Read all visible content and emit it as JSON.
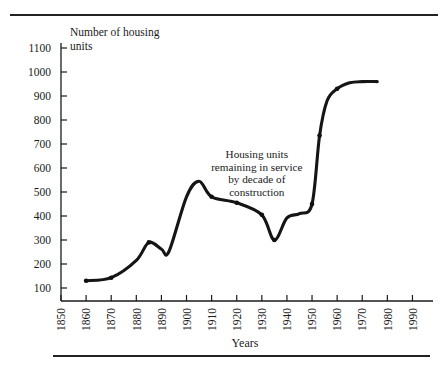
{
  "chart_data": {
    "type": "line",
    "title": "",
    "subtitle": "",
    "xlabel": "Years",
    "ylabel": "Number of housing units",
    "ylabel_line1": "Number of housing",
    "ylabel_line2": "units",
    "annotation": {
      "lines": [
        "Housing units",
        "remaining in service",
        "by decade of",
        "construction"
      ],
      "x": 1928,
      "y": 640
    },
    "xlim": [
      1850,
      1995
    ],
    "ylim": [
      75,
      1115
    ],
    "grid": false,
    "legend": null,
    "xticks": [
      1850,
      1860,
      1870,
      1880,
      1890,
      1900,
      1910,
      1920,
      1930,
      1940,
      1950,
      1960,
      1970,
      1980,
      1990
    ],
    "xtick_labels": [
      "1850",
      "1860",
      "1870",
      "1880",
      "1890",
      "1900",
      "1910",
      "1920",
      "1930",
      "1940",
      "1950",
      "1960",
      "1970",
      "1980",
      "1990"
    ],
    "yticks": [
      100,
      200,
      300,
      400,
      500,
      600,
      700,
      800,
      900,
      1000,
      1100
    ],
    "ytick_labels": [
      "100",
      "200",
      "300",
      "400",
      "500",
      "600",
      "700",
      "800",
      "900",
      "1000",
      "1100"
    ],
    "x": [
      1860,
      1870,
      1880,
      1885,
      1890,
      1893,
      1900,
      1905,
      1910,
      1920,
      1930,
      1935,
      1940,
      1945,
      1950,
      1953,
      1956,
      1960,
      1965,
      1970,
      1976
    ],
    "values": [
      130,
      143,
      215,
      290,
      262,
      252,
      480,
      545,
      480,
      455,
      405,
      300,
      392,
      410,
      450,
      735,
      880,
      930,
      955,
      960,
      960
    ],
    "markers": [
      {
        "x": 1860,
        "y": 130
      },
      {
        "x": 1870,
        "y": 143
      },
      {
        "x": 1885,
        "y": 290
      },
      {
        "x": 1910,
        "y": 480
      },
      {
        "x": 1920,
        "y": 455
      },
      {
        "x": 1930,
        "y": 405
      },
      {
        "x": 1935,
        "y": 300
      },
      {
        "x": 1950,
        "y": 450
      },
      {
        "x": 1953,
        "y": 735
      },
      {
        "x": 1960,
        "y": 930
      }
    ],
    "series_color": "#151515"
  }
}
